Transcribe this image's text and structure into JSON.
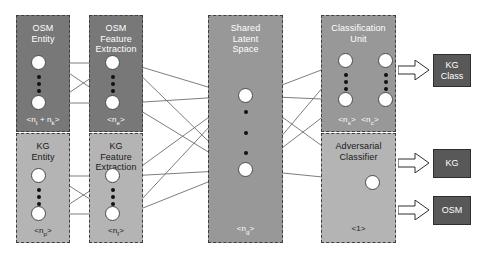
{
  "diagram": {
    "colors": {
      "dark_block": "#787878",
      "light_block": "#b4b4b4",
      "mid_block": "#989898",
      "output_box": "#585858",
      "node_fill": "#ffffff",
      "edge": "#6e6e6e",
      "border_dashed": "#3f3f3f",
      "background": "#ffffff"
    },
    "blocks": [
      {
        "id": "osm-entity",
        "title": "OSM\nEntity",
        "footer": "<n_t + n_k>",
        "shade": "dark"
      },
      {
        "id": "osm-feature-extraction",
        "title": "OSM\nFeature\nExtraction",
        "footer": "<n_e>",
        "shade": "dark"
      },
      {
        "id": "kg-entity",
        "title": "KG\nEntity",
        "footer": "<n_p>",
        "shade": "light"
      },
      {
        "id": "kg-feature-extraction",
        "title": "KG\nFeature\nExtraction",
        "footer": "<n_f>",
        "shade": "light"
      },
      {
        "id": "shared-latent-space",
        "title": "Shared\nLatent\nSpace",
        "footer": "<n_g>",
        "shade": "mid"
      },
      {
        "id": "classification-unit",
        "title": "Classification\nUnit",
        "footer_left": "<n_s>",
        "footer_right": "<n_c>",
        "shade": "mid"
      },
      {
        "id": "adversarial-classifier",
        "title": "Adversarial\nClassifier",
        "footer": "<1>",
        "shade": "light"
      }
    ],
    "outputs": [
      {
        "id": "kg-class",
        "label": "KG\nClass"
      },
      {
        "id": "kg",
        "label": "KG"
      },
      {
        "id": "osm",
        "label": "OSM"
      }
    ]
  }
}
